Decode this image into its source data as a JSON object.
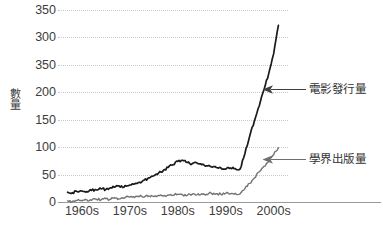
{
  "chart_data": {
    "type": "line",
    "title": "",
    "subtitle": "",
    "xlabel": "",
    "ylabel": "數量",
    "ylim": [
      0,
      350
    ],
    "xlim": [
      1958,
      2006
    ],
    "grid": true,
    "grid_axis": "y",
    "legend_position": "inline-annotations",
    "y_ticks": [
      {
        "value": 350,
        "label": "350"
      },
      {
        "value": 300,
        "label": "300"
      },
      {
        "value": 250,
        "label": "350"
      },
      {
        "value": 200,
        "label": "200"
      },
      {
        "value": 150,
        "label": "150"
      },
      {
        "value": 100,
        "label": "100"
      },
      {
        "value": 50,
        "label": "50"
      },
      {
        "value": 0,
        "label": "0"
      }
    ],
    "x_ticks": [
      {
        "value": 1963,
        "label": "1960s"
      },
      {
        "value": 1973,
        "label": "1970s"
      },
      {
        "value": 1983,
        "label": "1980s"
      },
      {
        "value": 1993,
        "label": "1990s"
      },
      {
        "value": 2003,
        "label": "2000s"
      }
    ],
    "series": [
      {
        "name": "電影發行量",
        "color": "#1a1a1a",
        "x": [
          1960,
          1961,
          1962,
          1963,
          1964,
          1965,
          1966,
          1967,
          1968,
          1969,
          1970,
          1971,
          1972,
          1973,
          1974,
          1975,
          1976,
          1977,
          1978,
          1979,
          1980,
          1981,
          1982,
          1983,
          1984,
          1985,
          1986,
          1987,
          1988,
          1989,
          1990,
          1991,
          1992,
          1993,
          1994,
          1995,
          1996,
          1997,
          1998,
          1999,
          2000,
          2001,
          2002,
          2003,
          2004
        ],
        "values": [
          18,
          17,
          19,
          20,
          19,
          21,
          22,
          24,
          23,
          26,
          28,
          27,
          30,
          31,
          33,
          36,
          40,
          44,
          48,
          53,
          58,
          63,
          68,
          74,
          76,
          72,
          70,
          71,
          68,
          66,
          64,
          63,
          62,
          60,
          62,
          61,
          60,
          88,
          120,
          148,
          175,
          205,
          235,
          270,
          322
        ]
      },
      {
        "name": "學界出版量",
        "color": "#737373",
        "x": [
          1960,
          1961,
          1962,
          1963,
          1964,
          1965,
          1966,
          1967,
          1968,
          1969,
          1970,
          1971,
          1972,
          1973,
          1974,
          1975,
          1976,
          1977,
          1978,
          1979,
          1980,
          1981,
          1982,
          1983,
          1984,
          1985,
          1986,
          1987,
          1988,
          1989,
          1990,
          1991,
          1992,
          1993,
          1994,
          1995,
          1996,
          1997,
          1998,
          1999,
          2000,
          2001,
          2002,
          2003,
          2004
        ],
        "values": [
          2,
          1,
          3,
          2,
          4,
          3,
          5,
          4,
          6,
          5,
          7,
          6,
          8,
          9,
          8,
          10,
          9,
          11,
          10,
          12,
          11,
          13,
          12,
          14,
          13,
          12,
          14,
          13,
          15,
          14,
          16,
          15,
          14,
          16,
          15,
          16,
          15,
          24,
          34,
          44,
          55,
          65,
          74,
          86,
          99
        ]
      }
    ],
    "annotations": [
      {
        "label": "電影發行量",
        "series": "電影發行量",
        "arrow": "left-arrow"
      },
      {
        "label": "學界出版量",
        "series": "學界出版量",
        "arrow": "left-arrow"
      }
    ]
  },
  "colors": {
    "film_series": "#1a1a1a",
    "academic_series": "#737373",
    "gridline": "#c8c8c8",
    "axis": "#999999",
    "text": "#3d3d3d",
    "background": "#ffffff"
  }
}
